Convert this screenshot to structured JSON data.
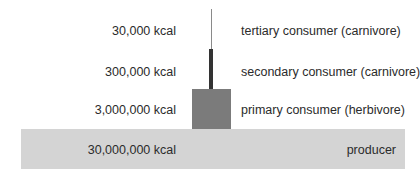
{
  "diagram": {
    "colors": {
      "producer": "#d4d4d4",
      "primary": "#7b7b7b",
      "secondary": "#333333",
      "tertiary": "#8a8a8a",
      "text": "#2b2b2b"
    },
    "levels": [
      {
        "name": "tertiary consumer (carnivore)",
        "energy": "30,000 kcal"
      },
      {
        "name": "secondary consumer (carnivore)",
        "energy": "300,000 kcal"
      },
      {
        "name": "primary consumer (herbivore)",
        "energy": "3,000,000 kcal"
      },
      {
        "name": "producer",
        "energy": "30,000,000 kcal"
      }
    ]
  }
}
